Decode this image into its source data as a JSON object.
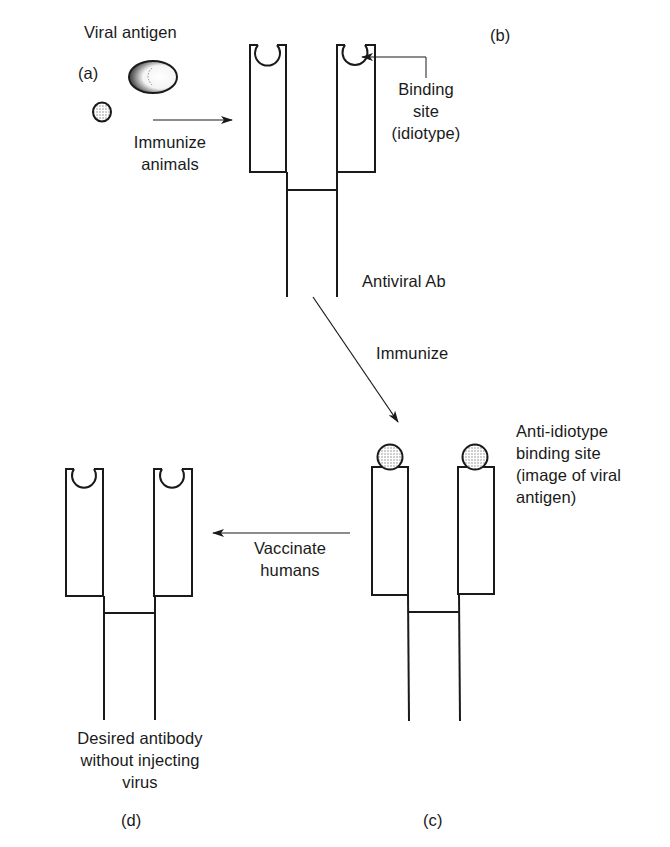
{
  "panels": {
    "a": {
      "tag": "(a)",
      "title": "Viral antigen"
    },
    "b": {
      "tag": "(b)",
      "caption": "Antiviral Ab",
      "annotation": [
        "Binding",
        "site",
        "(idiotype)"
      ]
    },
    "c": {
      "tag": "(c)",
      "annotation": [
        "Anti-idiotype",
        "binding site",
        "(image of viral",
        "antigen)"
      ]
    },
    "d": {
      "tag": "(d)",
      "caption": [
        "Desired antibody",
        "without injecting",
        "virus"
      ]
    }
  },
  "arrows": {
    "a_to_b": [
      "Immunize",
      "animals"
    ],
    "b_to_c": [
      "Immunize"
    ],
    "c_to_d": [
      "Vaccinate",
      "humans"
    ]
  },
  "colors": {
    "stroke": "#1a1a1a",
    "background": "#ffffff",
    "stipple": "#8a8a8a"
  }
}
